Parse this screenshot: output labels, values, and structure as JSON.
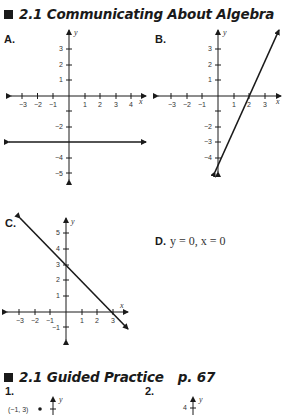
{
  "sections": [
    {
      "title": "2.1 Communicating About Algebra",
      "page": "p. 66"
    },
    {
      "title": "2.1 Guided Practice",
      "page": "p. 67"
    }
  ],
  "graphs": {
    "A": {
      "label": "A.",
      "x_ticks": [
        "-3",
        "-2",
        "-1",
        "1",
        "2",
        "3",
        "4"
      ],
      "y_ticks": [
        "3",
        "2",
        "1",
        "-2",
        "-4",
        "-5"
      ],
      "x_axis": "x",
      "y_axis": "y",
      "line": "y = -3"
    },
    "B": {
      "label": "B.",
      "x_ticks": [
        "-3",
        "-2",
        "-1",
        "1",
        "2",
        "3"
      ],
      "y_ticks": [
        "3",
        "2",
        "1",
        "-2",
        "-3",
        "-4"
      ],
      "x_axis": "x",
      "y_axis": "y",
      "line": "through (2,0), steep positive slope"
    },
    "C": {
      "label": "C.",
      "x_ticks": [
        "-3",
        "-2",
        "-1",
        "1",
        "2",
        "3"
      ],
      "y_ticks": [
        "5",
        "4",
        "3",
        "2",
        "1",
        "-1"
      ],
      "x_axis": "x",
      "y_axis": "y",
      "line": "y = -x + 3"
    }
  },
  "answer_d": {
    "label": "D.",
    "text": "y = 0, x = 0"
  },
  "practice": {
    "items": [
      {
        "label": "1.",
        "point_label": "(−1, 3)",
        "y_axis": "y"
      },
      {
        "label": "2.",
        "tick_label": "4",
        "y_axis": "y"
      }
    ]
  },
  "colors": {
    "ink": "#1a1a1a",
    "tick_text": "#333333",
    "background": "#ffffff"
  }
}
